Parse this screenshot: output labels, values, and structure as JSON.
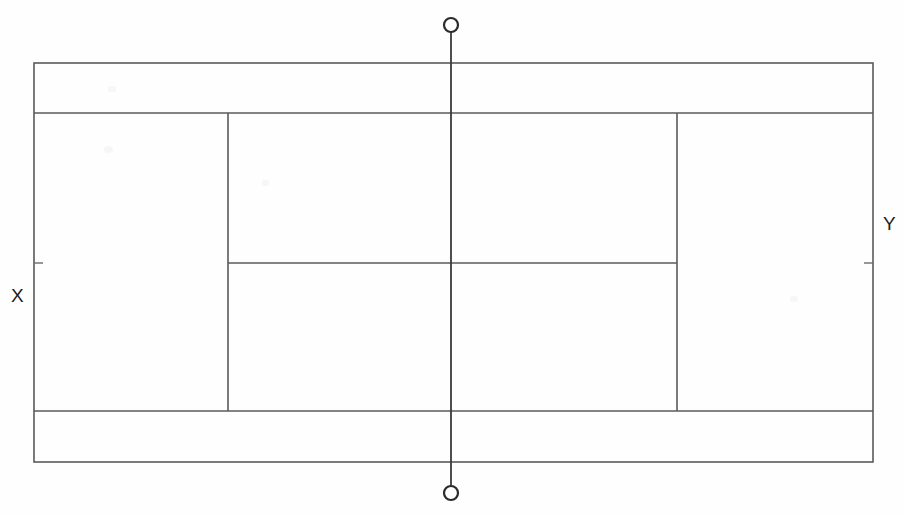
{
  "diagram": {
    "background_color": "#fefefe",
    "line_color": "#5a5a5a",
    "label_color": "#1d1d1d",
    "width": 904,
    "height": 517,
    "labels": {
      "left": "X",
      "right": "Y"
    },
    "geometry": {
      "outer_left": 34,
      "outer_right": 873,
      "outer_top": 63,
      "outer_bottom": 462,
      "doubles_alley_top_y": 113,
      "doubles_alley_bottom_y": 411,
      "singles_left_x": 228,
      "singles_right_x": 677,
      "service_line_y": 263,
      "net_line_x": 451,
      "net_post_top_y": 25,
      "net_post_bottom_y": 493,
      "net_post_radius": 7,
      "tick_length": 9
    },
    "elements": {
      "outer_rect": "doubles-court-boundary",
      "top_alley": "top-doubles-alley",
      "bottom_alley": "bottom-doubles-alley",
      "left_singles_sideline": "left-singles-sideline",
      "right_singles_sideline": "right-singles-sideline",
      "service_line": "center-service-line",
      "net_line": "net-center-line",
      "top_post": "top-net-post",
      "bottom_post": "bottom-net-post",
      "left_tick": "left-sideline-tick",
      "right_tick": "right-sideline-tick"
    }
  }
}
